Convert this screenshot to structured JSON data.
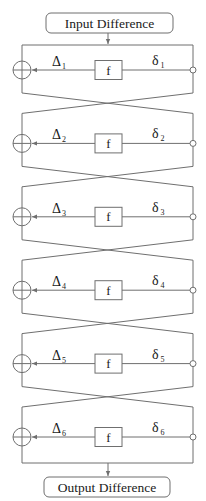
{
  "diagram": {
    "type": "feistel-differential",
    "input_label": "Input Difference",
    "output_label": "Output Difference",
    "function_label": "f",
    "delta_symbol": "Δ",
    "small_delta_symbol": "δ",
    "rounds": [
      {
        "round": 1,
        "left_label": "Δ",
        "left_sub": "1",
        "right_label": "δ",
        "right_sub": "1"
      },
      {
        "round": 2,
        "left_label": "Δ",
        "left_sub": "2",
        "right_label": "δ",
        "right_sub": "2"
      },
      {
        "round": 3,
        "left_label": "Δ",
        "left_sub": "3",
        "right_label": "δ",
        "right_sub": "3"
      },
      {
        "round": 4,
        "left_label": "Δ",
        "left_sub": "4",
        "right_label": "δ",
        "right_sub": "4"
      },
      {
        "round": 5,
        "left_label": "Δ",
        "left_sub": "5",
        "right_label": "δ",
        "right_sub": "5"
      },
      {
        "round": 6,
        "left_label": "Δ",
        "left_sub": "6",
        "right_label": "δ",
        "right_sub": "6"
      }
    ],
    "colors": {
      "line": "#6f6f6f",
      "text": "#1a1a1a",
      "background": "#ffffff"
    }
  }
}
